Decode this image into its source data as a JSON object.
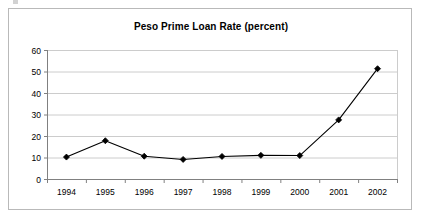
{
  "chart_data": {
    "type": "line",
    "title": "Peso Prime Loan Rate (percent)",
    "xlabel": "",
    "ylabel": "",
    "categories": [
      "1994",
      "1995",
      "1996",
      "1997",
      "1998",
      "1999",
      "2000",
      "2001",
      "2002"
    ],
    "values": [
      10.2,
      17.8,
      10.6,
      9.1,
      10.5,
      11.0,
      10.9,
      27.5,
      51.3
    ],
    "ylim": [
      0,
      60
    ],
    "yticks": [
      0,
      10,
      20,
      30,
      40,
      50,
      60
    ],
    "ytick_labels": [
      "0",
      "10",
      "20",
      "30",
      "40",
      "50",
      "60"
    ],
    "grid": "horizontal",
    "legend": "none",
    "series": [
      {
        "name": "Peso Prime Loan Rate",
        "values": [
          10.2,
          17.8,
          10.6,
          9.1,
          10.5,
          11.0,
          10.9,
          27.5,
          51.3
        ],
        "line_color": "#000000",
        "marker": "diamond",
        "marker_color": "#000000"
      }
    ],
    "colors": {
      "line": "#000000",
      "marker": "#000000",
      "grid": "#cccccc",
      "axis": "#808080",
      "text": "#000000",
      "background": "#ffffff",
      "frame": "#b9b9b9"
    }
  }
}
